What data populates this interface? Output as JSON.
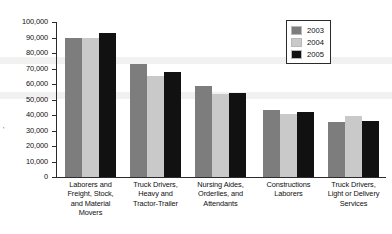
{
  "chart_data": {
    "type": "bar",
    "title": "",
    "subtitle": "",
    "xlabel": "",
    "ylabel": "",
    "ylim": [
      0,
      100000
    ],
    "grid": false,
    "legend_position": "top-right",
    "categories": [
      "Laborers and Freight, Stock, and Material Movers",
      "Truck Drivers, Heavy and Tractor-Trailer",
      "Nursing Aides, Orderlies, and Attendants",
      "Constructions Laborers",
      "Truck Drivers, Light or Delivery Services"
    ],
    "category_lines": [
      [
        "Laborers and",
        "Freight, Stock,",
        "and Material",
        "Movers"
      ],
      [
        "Truck Drivers,",
        "Heavy and",
        "Tractor-Trailer"
      ],
      [
        "Nursing Aides,",
        "Orderlies, and",
        "Attendants"
      ],
      [
        "Constructions",
        "Laborers"
      ],
      [
        "Truck Drivers,",
        "Light or Delivery",
        "Services"
      ]
    ],
    "series": [
      {
        "name": "2003",
        "color": "#7d7d7d",
        "values": [
          90000,
          73000,
          58500,
          43500,
          35800
        ]
      },
      {
        "name": "2004",
        "color": "#c9c9c9",
        "values": [
          90000,
          65000,
          53500,
          40500,
          39500
        ]
      },
      {
        "name": "2005",
        "color": "#111111",
        "values": [
          93000,
          67500,
          54500,
          42000,
          36200
        ]
      }
    ],
    "yticks": [
      0,
      10000,
      20000,
      30000,
      40000,
      50000,
      60000,
      70000,
      80000,
      90000,
      100000
    ],
    "ytick_labels": [
      "0",
      "10,000",
      "20,000",
      "30,000",
      "40,000",
      "50,000",
      "60,000",
      "70,000",
      "80,000",
      "90,000",
      "100,000"
    ]
  },
  "legend": {
    "entries": [
      {
        "label": "2003",
        "color": "#7d7d7d"
      },
      {
        "label": "2004",
        "color": "#c9c9c9"
      },
      {
        "label": "2005",
        "color": "#111111"
      }
    ]
  }
}
